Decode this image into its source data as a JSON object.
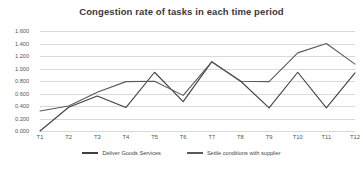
{
  "chart_data": {
    "type": "line",
    "title": "Congestion rate of tasks in each time period",
    "xlabel": "",
    "ylabel": "",
    "categories": [
      "T1",
      "T2",
      "T3",
      "T4",
      "T5",
      "T6",
      "T7",
      "T8",
      "T9",
      "T10",
      "T11",
      "T12"
    ],
    "ylim": [
      0.0,
      1.6
    ],
    "ytick_labels": [
      "0.000",
      "0.200",
      "0.400",
      "0.600",
      "0.800",
      "1.000",
      "1.200",
      "1.400",
      "1.600"
    ],
    "ytick_values": [
      0.0,
      0.2,
      0.4,
      0.6,
      0.8,
      1.0,
      1.2,
      1.4,
      1.6
    ],
    "grid": true,
    "legend_position": "bottom",
    "series": [
      {
        "name": "Deliver Goods Services",
        "color": "#404040",
        "values": [
          0.0,
          0.38,
          0.56,
          0.375,
          0.94,
          0.47,
          1.11,
          0.8,
          0.37,
          0.94,
          0.37,
          0.93
        ]
      },
      {
        "name": "Settle conditions with supplier",
        "color": "#5a5a5a",
        "values": [
          0.32,
          0.4,
          0.62,
          0.79,
          0.795,
          0.57,
          1.105,
          0.795,
          0.79,
          1.25,
          1.4,
          1.07
        ]
      }
    ]
  }
}
